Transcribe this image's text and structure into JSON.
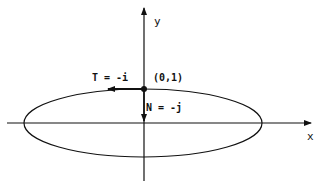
{
  "diagram": {
    "axes": {
      "x_label": "x",
      "y_label": "y"
    },
    "curve": "ellipse",
    "point": {
      "label": "(0,1)"
    },
    "tangent": {
      "label": "T = -i"
    },
    "normal": {
      "label": "N = -j"
    },
    "colors": {
      "stroke": "#111111",
      "background": "#ffffff"
    }
  }
}
